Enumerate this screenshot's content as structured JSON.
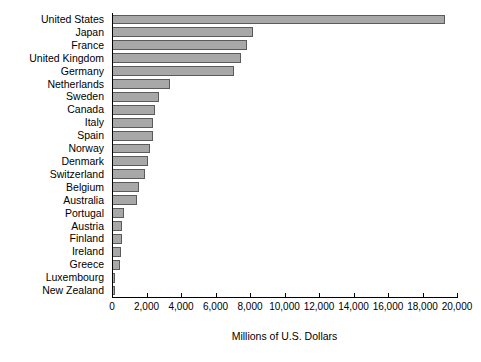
{
  "chart_data": {
    "type": "bar",
    "orientation": "horizontal",
    "title": "",
    "xlabel": "Millions of U.S. Dollars",
    "ylabel": "",
    "xlim": [
      0,
      20000
    ],
    "xticks": [
      "0",
      "2,000",
      "4,000",
      "6,000",
      "8,000",
      "10,000",
      "12,000",
      "14,000",
      "16,000",
      "18,000",
      "20,000"
    ],
    "xtick_values": [
      0,
      2000,
      4000,
      6000,
      8000,
      10000,
      12000,
      14000,
      16000,
      18000,
      20000
    ],
    "grid": false,
    "legend": false,
    "bar_fill_color": "#a8a8a8",
    "bar_edge_color": "#5b5b5b",
    "categories": [
      "United States",
      "Japan",
      "France",
      "United Kingdom",
      "Germany",
      "Netherlands",
      "Sweden",
      "Canada",
      "Italy",
      "Spain",
      "Norway",
      "Denmark",
      "Switzerland",
      "Belgium",
      "Australia",
      "Portugal",
      "Austria",
      "Finland",
      "Ireland",
      "Greece",
      "Luxembourg",
      "New Zealand"
    ],
    "values": [
      19300,
      8150,
      7800,
      7500,
      7100,
      3350,
      2700,
      2500,
      2400,
      2350,
      2200,
      2100,
      1900,
      1550,
      1450,
      700,
      600,
      600,
      500,
      450,
      200,
      150
    ]
  }
}
